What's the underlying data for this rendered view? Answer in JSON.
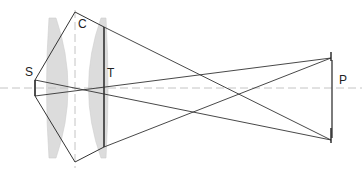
{
  "diagram": {
    "type": "optical-ray-diagram",
    "labels": {
      "source": "S",
      "lens": "C",
      "lens_edge": "T",
      "plane": "P"
    },
    "colors": {
      "line": "#222222",
      "lens_fill": "#d9d9d9",
      "axis": "#bbbbbb",
      "background": "#ffffff"
    },
    "axis": {
      "optical_axis_y": 88,
      "lens_axis_x": 75
    },
    "elements": {
      "source": {
        "x": 35,
        "y1": 80,
        "y2": 96
      },
      "lens_top": {
        "x": 75,
        "y": 12
      },
      "lens_bottom": {
        "x": 75,
        "y": 162
      },
      "t_bar": {
        "x": 104,
        "y1": 27,
        "y2": 147
      },
      "p_bar": {
        "x": 331,
        "y1": 58,
        "y2": 140
      }
    }
  }
}
